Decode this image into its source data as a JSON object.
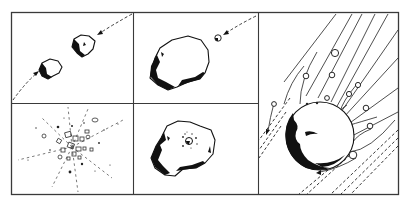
{
  "figure": {
    "colors": {
      "ink": "#111111",
      "frame": "#3a3a3a",
      "background": "#ffffff"
    },
    "frame": {
      "x": 11,
      "y": 12,
      "width": 387,
      "height": 183
    },
    "dividers": {
      "vertical": [
        133,
        258
      ],
      "horizontal_y": 103,
      "horizontal_span": [
        11,
        258
      ]
    },
    "panels": [
      {
        "id": "top-left",
        "depicts": "two irregular bodies approaching each other along a dashed curved trajectory with arrows"
      },
      {
        "id": "top-middle",
        "depicts": "large irregular asteroid with a small body approaching along a dashed arrowed path"
      },
      {
        "id": "bottom-left",
        "depicts": "catastrophic fragmentation: debris fragments scattered along radiating dashed lines"
      },
      {
        "id": "bottom-middle",
        "depicts": "large asteroid with a small impact crater and ejecta specks"
      },
      {
        "id": "right",
        "depicts": "spherical body sweeping through a stream of particles along parallel lines, particles deflected, dashed wake"
      }
    ]
  }
}
